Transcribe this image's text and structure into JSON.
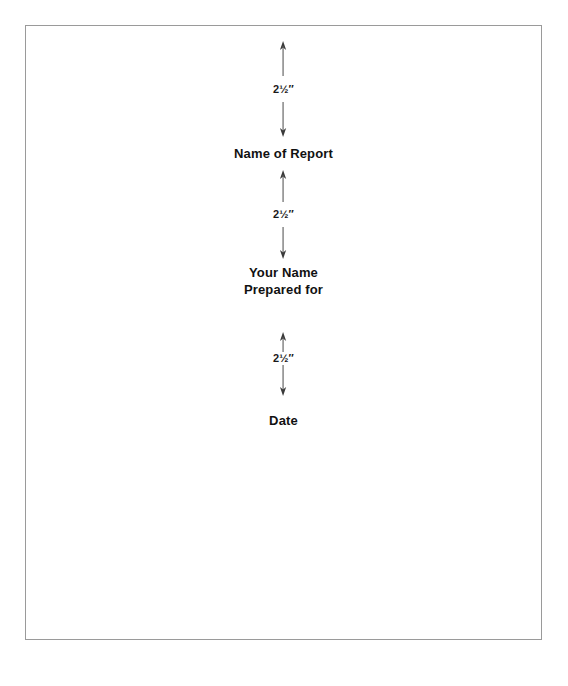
{
  "document": {
    "type": "report-title-page-layout-diagram",
    "page_border_color": "#9a9a9a",
    "text_color": "#111111",
    "rule_color": "#4a4a4a"
  },
  "measurements": {
    "top_margin": {
      "value": "2½″",
      "whole": "2",
      "fraction": "½",
      "unit": "″",
      "label": "2½″"
    },
    "between_title_and_byline": {
      "value": "2½″",
      "whole": "2",
      "fraction": "½",
      "unit": "″",
      "label": "2½″"
    },
    "between_byline_and_date": {
      "value": "2½″",
      "whole": "2",
      "fraction": "½",
      "unit": "″",
      "label": "2½″"
    }
  },
  "title_page": {
    "report_title_placeholder": "Name of Report",
    "byline": {
      "line1": "Your Name",
      "line2": "Prepared for"
    },
    "date_placeholder": "Date"
  }
}
